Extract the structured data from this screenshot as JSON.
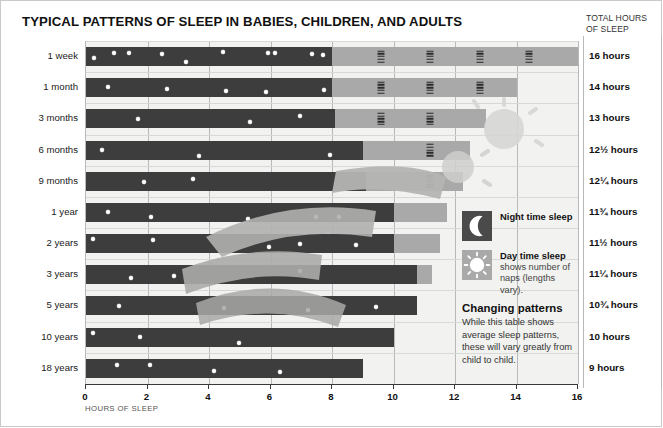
{
  "title": "TYPICAL PATTERNS OF SLEEP IN BABIES, CHILDREN, AND ADULTS",
  "right_header": {
    "line1": "TOTAL HOURS",
    "line2": "OF SLEEP"
  },
  "axis_title": "HOURS OF SLEEP",
  "legend": {
    "night_label": "Night time sleep",
    "night_icon": "moon-icon",
    "day_label": "Day time sleep",
    "day_sub": "shows number of naps (lengths vary).",
    "day_icon": "sun-icon",
    "note_heading": "Changing patterns",
    "note_body": "While this table shows average sleep patterns, these will vary greatly from child to child."
  },
  "colors": {
    "night": "#3d3d3d",
    "day": "#a9a9a9",
    "plot_background": "#f2f2f0",
    "gridline": "#b9b9b9",
    "text": "#1a1a1a"
  },
  "chart_data": {
    "type": "bar",
    "title": "TYPICAL PATTERNS OF SLEEP IN BABIES, CHILDREN, AND ADULTS",
    "xlabel": "HOURS OF SLEEP",
    "ylabel": "",
    "xlim": [
      0,
      16
    ],
    "xticks": [
      0,
      2,
      4,
      6,
      8,
      10,
      12,
      14,
      16
    ],
    "grid": true,
    "orientation": "horizontal",
    "stacked": true,
    "legend_position": "right",
    "series": [
      {
        "name": "Night time sleep",
        "color": "#3d3d3d",
        "values": [
          8,
          8,
          8.1,
          9,
          9.1,
          10,
          10,
          10.75,
          10.75,
          10,
          9
        ]
      },
      {
        "name": "Day time sleep",
        "color": "#a9a9a9",
        "values": [
          8,
          6,
          4.9,
          3.5,
          3.15,
          1.75,
          1.5,
          0.5,
          0,
          0,
          0
        ]
      }
    ],
    "categories": [
      "1 week",
      "1 month",
      "3 months",
      "6 months",
      "9 months",
      "1 year",
      "2 years",
      "3 years",
      "5 years",
      "10 years",
      "18 years"
    ],
    "totals_labels": [
      "16 hours",
      "14 hours",
      "13 hours",
      "12½ hours",
      "12¼ hours",
      "11¾ hours",
      "11½ hours",
      "11¼ hours",
      "10¾ hours",
      "10 hours",
      "9 hours"
    ],
    "totals_values": [
      16,
      14,
      13,
      12.5,
      12.25,
      11.75,
      11.5,
      11.25,
      10.75,
      10,
      9
    ],
    "nap_marks": [
      [
        9.6,
        11.2,
        12.8,
        14.4
      ],
      [
        9.6,
        11.2,
        12.8
      ],
      [
        9.6,
        11.2
      ],
      [
        11.2
      ],
      [
        11.2
      ],
      [],
      [],
      [],
      [],
      [],
      []
    ],
    "star_marks": [
      [
        0.45,
        2.1,
        3.3,
        6.0,
        8.0,
        11.0,
        14.6,
        15.2,
        18.2,
        19.1
      ],
      [
        1.6,
        6.4,
        11.2,
        14.5,
        19.2
      ],
      [
        4.0,
        13.0,
        17.0,
        22.5
      ],
      [
        1.0,
        8.0,
        17.5
      ],
      [
        4.0,
        7.5,
        20.0
      ],
      [
        1.3,
        4.1,
        10.4,
        14.8,
        16.3
      ],
      [
        0.3,
        4.2,
        11.8,
        13.8,
        17.4
      ],
      [
        2.6,
        5.2,
        12.8
      ],
      [
        1.9,
        8.2,
        13.3,
        17.4
      ],
      [
        0.3,
        3.4,
        9.8
      ],
      [
        2.1,
        4.5,
        9.1,
        13.9
      ]
    ]
  }
}
